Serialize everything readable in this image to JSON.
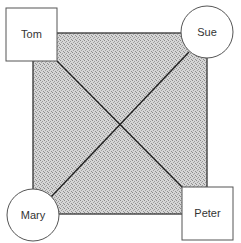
{
  "diagram": {
    "type": "communication-network",
    "center_region": {
      "shape": "square",
      "fill": "stippled-gray"
    },
    "nodes": [
      {
        "id": "tom",
        "label": "Tom",
        "shape": "square",
        "position": "top-left"
      },
      {
        "id": "sue",
        "label": "Sue",
        "shape": "circle",
        "position": "top-right"
      },
      {
        "id": "mary",
        "label": "Mary",
        "shape": "circle",
        "position": "bottom-left"
      },
      {
        "id": "peter",
        "label": "Peter",
        "shape": "square",
        "position": "bottom-right"
      }
    ],
    "edges": [
      {
        "from": "tom",
        "to": "sue"
      },
      {
        "from": "sue",
        "to": "peter"
      },
      {
        "from": "peter",
        "to": "mary"
      },
      {
        "from": "mary",
        "to": "tom"
      },
      {
        "from": "tom",
        "to": "peter"
      },
      {
        "from": "sue",
        "to": "mary"
      }
    ]
  },
  "colors": {
    "stroke": "#333333",
    "fill_shade": "#c8c8c8",
    "node_fill": "#ffffff"
  }
}
